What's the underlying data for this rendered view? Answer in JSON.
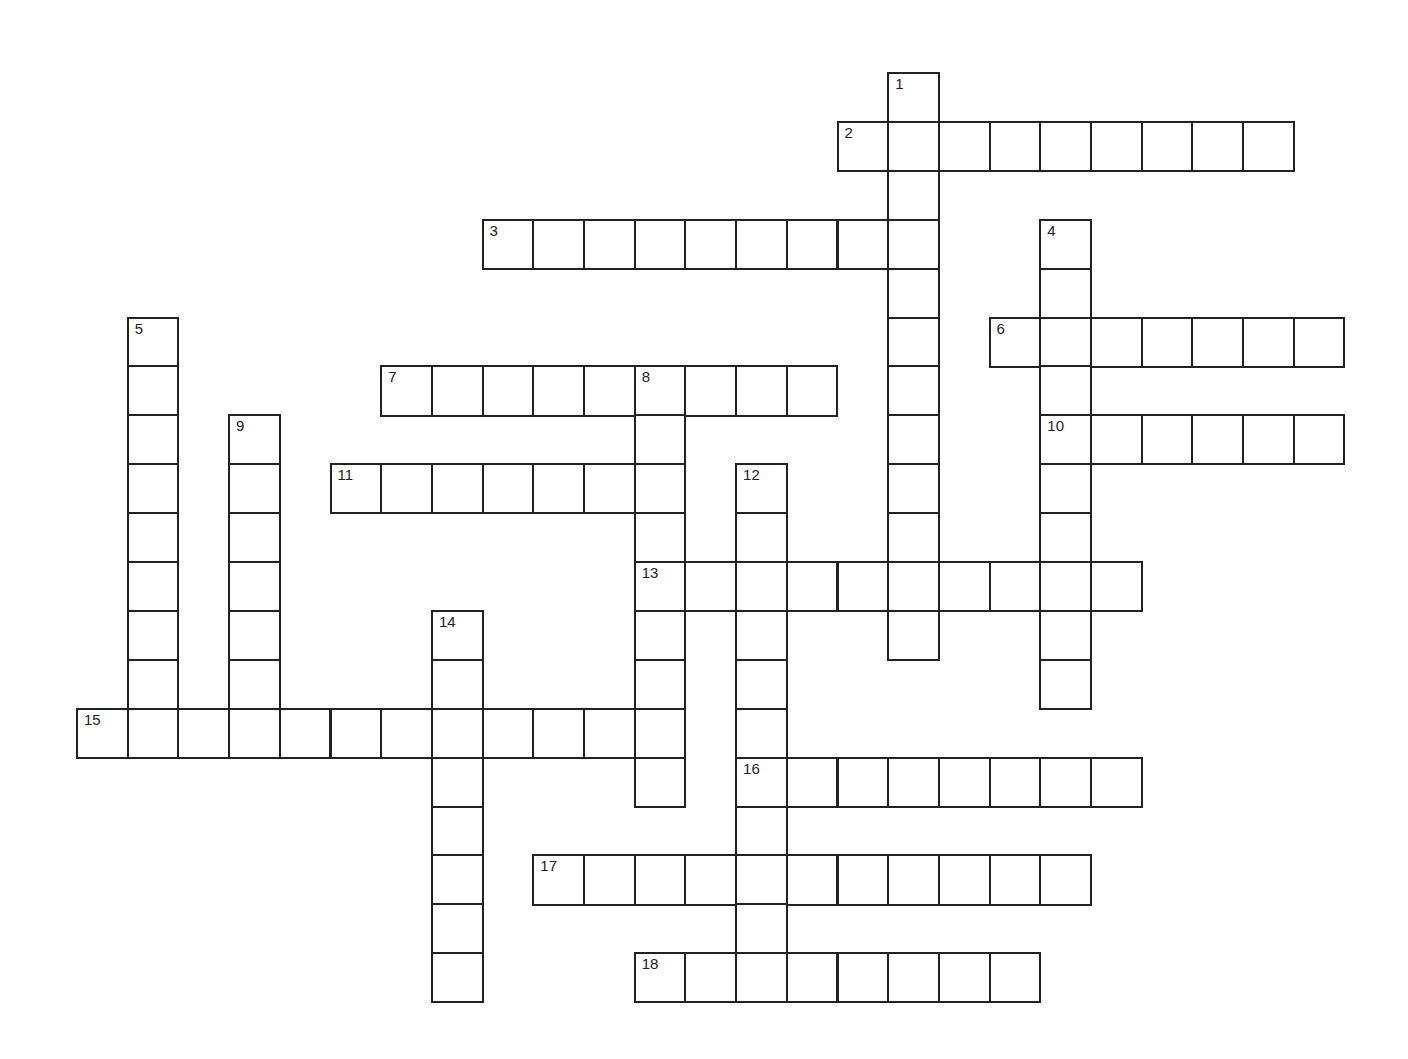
{
  "puzzle": {
    "type": "crossword",
    "cell_size": 50.7,
    "origin": {
      "x": 76,
      "y": 72,
      "row_step": 48.9
    },
    "words": [
      {
        "number": 1,
        "direction": "down",
        "col": 16,
        "row": 0,
        "length": 12
      },
      {
        "number": 2,
        "direction": "across",
        "col": 15,
        "row": 1,
        "length": 9
      },
      {
        "number": 3,
        "direction": "across",
        "col": 8,
        "row": 3,
        "length": 9
      },
      {
        "number": 4,
        "direction": "down",
        "col": 19,
        "row": 3,
        "length": 10
      },
      {
        "number": 5,
        "direction": "down",
        "col": 1,
        "row": 5,
        "length": 8
      },
      {
        "number": 6,
        "direction": "across",
        "col": 18,
        "row": 5,
        "length": 7
      },
      {
        "number": 7,
        "direction": "across",
        "col": 6,
        "row": 6,
        "length": 9
      },
      {
        "number": 8,
        "direction": "down",
        "col": 11,
        "row": 6,
        "length": 9
      },
      {
        "number": 9,
        "direction": "down",
        "col": 3,
        "row": 7,
        "length": 6
      },
      {
        "number": 10,
        "direction": "across",
        "col": 19,
        "row": 7,
        "length": 6
      },
      {
        "number": 11,
        "direction": "across",
        "col": 5,
        "row": 8,
        "length": 7
      },
      {
        "number": 12,
        "direction": "down",
        "col": 13,
        "row": 8,
        "length": 10
      },
      {
        "number": 13,
        "direction": "across",
        "col": 11,
        "row": 10,
        "length": 10
      },
      {
        "number": 14,
        "direction": "down",
        "col": 7,
        "row": 11,
        "length": 8
      },
      {
        "number": 15,
        "direction": "across",
        "col": 0,
        "row": 13,
        "length": 12
      },
      {
        "number": 16,
        "direction": "across",
        "col": 13,
        "row": 14,
        "length": 8
      },
      {
        "number": 17,
        "direction": "across",
        "col": 9,
        "row": 16,
        "length": 11
      },
      {
        "number": 18,
        "direction": "across",
        "col": 11,
        "row": 18,
        "length": 8
      }
    ]
  }
}
